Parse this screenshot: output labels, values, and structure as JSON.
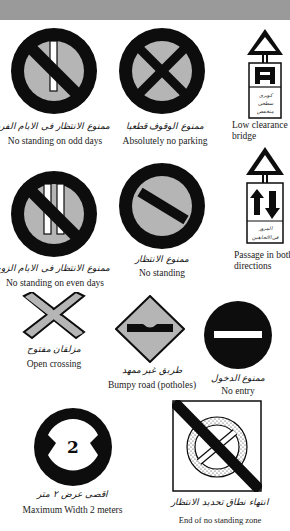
{
  "header_bar": {
    "color": "#9a9a9a"
  },
  "colors": {
    "sign_black": "#0d0d0d",
    "sign_grey": "#b5b5b5",
    "plate_white": "#ffffff"
  },
  "signs": [
    {
      "id": "no-standing-odd-days",
      "caption_ar": "ممنوع الانتظار فى الايام الفردية",
      "caption_en": "No standing on odd days"
    },
    {
      "id": "absolutely-no-parking",
      "caption_ar": "ممنوع الوقوف قطعيا",
      "caption_en": "Absolutely no parking"
    },
    {
      "id": "low-clearance-bridge",
      "plate_text_ar": "كوبرى سطحى منخفض",
      "caption_en_line1": "Low clearance",
      "caption_en_line2": "bridge"
    },
    {
      "id": "no-standing-even-days",
      "caption_ar": "ممنوع الانتظار فى الايام الزوجية",
      "caption_en": "No standing on even days"
    },
    {
      "id": "no-standing",
      "caption_ar": "ممنوع الانتظار",
      "caption_en": "No standing"
    },
    {
      "id": "passage-both-directions",
      "plate_text_ar": "المرور فى الاتجاهين",
      "caption_en_line1": "Passage in both",
      "caption_en_line2": "directions"
    },
    {
      "id": "open-crossing",
      "caption_ar": "مزلقان مفتوح",
      "caption_en": "Open crossing"
    },
    {
      "id": "bumpy-road",
      "caption_ar": "طريق غير ممهد",
      "caption_en": "Bumpy road (potholes)"
    },
    {
      "id": "no-entry",
      "caption_ar": "ممنوع الدخول",
      "caption_en": "No entry"
    },
    {
      "id": "maximum-width",
      "sign_value": "2",
      "caption_ar": "اقصى عرض ٢ متر",
      "caption_en": "Maximum Width 2 meters"
    },
    {
      "id": "end-no-standing-zone",
      "caption_ar": "انتهاء نطاق تحديد الانتظار",
      "caption_en": "End of no standing zone"
    }
  ]
}
